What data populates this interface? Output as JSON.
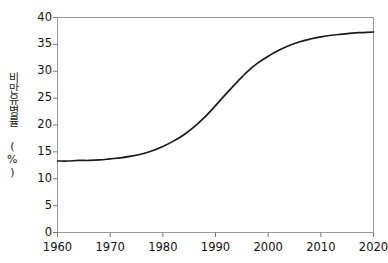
{
  "chart_data": {
    "type": "line",
    "title": "",
    "subtitle": "",
    "xlabel": "",
    "ylabel": "비만유병률 (%)",
    "ylabel_text_raw": "비만유병률 (%)",
    "xlim": [
      1960,
      2020
    ],
    "ylim": [
      0,
      40
    ],
    "grid": false,
    "legend": null,
    "annotations": [],
    "xtick_labels": [
      "1960",
      "1970",
      "1980",
      "1990",
      "2000",
      "2010",
      "2020"
    ],
    "xtick_values": [
      1960,
      1970,
      1980,
      1990,
      2000,
      2010,
      2020
    ],
    "ytick_labels": [
      "0",
      "5",
      "10",
      "15",
      "20",
      "25",
      "30",
      "35",
      "40"
    ],
    "ytick_values": [
      0,
      5,
      10,
      15,
      20,
      25,
      30,
      35,
      40
    ],
    "series": [
      {
        "name": "비만유병률",
        "color": "#1a1a1a",
        "x": [
          1960,
          1962,
          1964,
          1966,
          1968,
          1970,
          1972,
          1974,
          1976,
          1978,
          1980,
          1982,
          1984,
          1986,
          1988,
          1990,
          1992,
          1994,
          1996,
          1998,
          2000,
          2002,
          2004,
          2006,
          2008,
          2010,
          2012,
          2014,
          2016,
          2018,
          2020
        ],
        "values": [
          13.3,
          13.3,
          13.4,
          13.4,
          13.5,
          13.7,
          13.9,
          14.2,
          14.6,
          15.2,
          16.0,
          17.0,
          18.2,
          19.7,
          21.5,
          23.6,
          25.8,
          27.9,
          29.9,
          31.5,
          32.8,
          33.9,
          34.8,
          35.5,
          36.0,
          36.4,
          36.7,
          36.9,
          37.1,
          37.2,
          37.3
        ]
      }
    ],
    "curve_description": "logistic sigmoid rising from 13.3% to 37.3% with inflection near 1992"
  },
  "axes": {
    "frame_color": "#9a9a9a",
    "tick_color": "#777777",
    "line_color": "#1a1a1a"
  }
}
